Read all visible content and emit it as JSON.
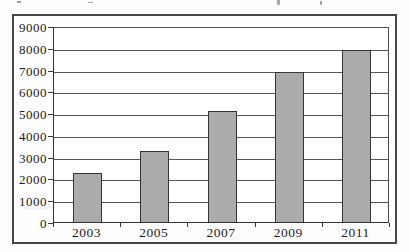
{
  "page": {
    "background_color": "#fdfdfd",
    "frame_border_color": "#474747"
  },
  "chart_data": {
    "type": "bar",
    "title": "",
    "categories": [
      "2003",
      "2005",
      "2007",
      "2009",
      "2011"
    ],
    "values": [
      2250,
      3250,
      5100,
      6900,
      7900
    ],
    "xlabel": "",
    "ylabel": "",
    "ylim": [
      0,
      9000
    ],
    "ytick_step": 1000,
    "yticks": [
      0,
      1000,
      2000,
      3000,
      4000,
      5000,
      6000,
      7000,
      8000,
      9000
    ],
    "grid": true,
    "legend": "none",
    "bar_fill": "#ababab",
    "bar_border": "#343434",
    "gridline_color": "#565656",
    "axis_color": "#333333",
    "tick_label_color": "#1b1b1b"
  }
}
